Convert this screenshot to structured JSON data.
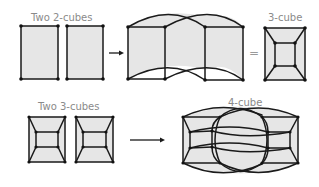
{
  "labels": {
    "two_2cubes": "Two 2-cubes",
    "three_cube": "3-cube",
    "two_3cubes": "Two 3-cubes",
    "four_cube": "4-cube",
    "equals": "="
  },
  "colors": {
    "fill": "#e6e6e6",
    "edge": "#1a1a1a",
    "label": "#8a8a8a"
  },
  "rows": [
    {
      "name": "top-row",
      "input_label": "Two 2-cubes",
      "operator": "arrow",
      "result_intermediate": "extruded squares with curved connecting edges",
      "equals": "=",
      "result_label": "3-cube"
    },
    {
      "name": "bottom-row",
      "input_label": "Two 3-cubes",
      "operator": "arrow",
      "result_label": "4-cube"
    }
  ]
}
